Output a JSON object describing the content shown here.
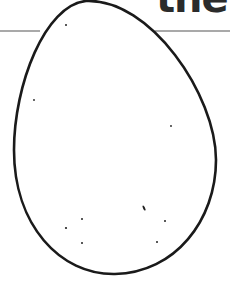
{
  "title": {
    "visible_text": "the",
    "trailing_fragment": "'"
  },
  "illustration": {
    "subject": "egg-outline",
    "stroke_color": "#1a1a1a",
    "background_color": "#ffffff",
    "speckles": 11
  },
  "divider": {
    "color": "#555555"
  }
}
